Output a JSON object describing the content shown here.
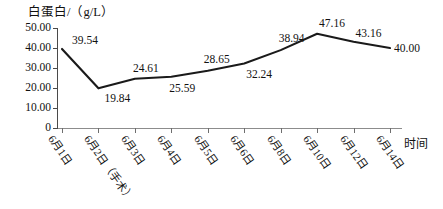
{
  "chart_data": {
    "type": "line",
    "title": "",
    "ylabel": "白蛋白/（g/L）",
    "xlabel": "时间",
    "ylim": [
      0,
      50
    ],
    "grid": false,
    "legend": null,
    "y_ticks": [
      "50.00",
      "40.00",
      "30.00",
      "20.00",
      "10.00",
      "0"
    ],
    "y_tick_values": [
      50,
      40,
      30,
      20,
      10,
      0
    ],
    "categories": [
      "6月1日",
      "6月2日（手术）",
      "6月3日",
      "6月4日",
      "6月5日",
      "6月6日",
      "6月8日",
      "6月10日",
      "6月12日",
      "6月14日"
    ],
    "values": [
      39.54,
      19.84,
      24.61,
      25.59,
      28.65,
      32.24,
      38.94,
      47.16,
      43.16,
      40.0
    ],
    "value_labels": [
      "39.54",
      "19.84",
      "24.61",
      "25.59",
      "28.65",
      "32.24",
      "38.94",
      "47.16",
      "43.16",
      "40.00"
    ],
    "series_color": "#1a1a1a",
    "axis_color": "#4a4a4a"
  }
}
